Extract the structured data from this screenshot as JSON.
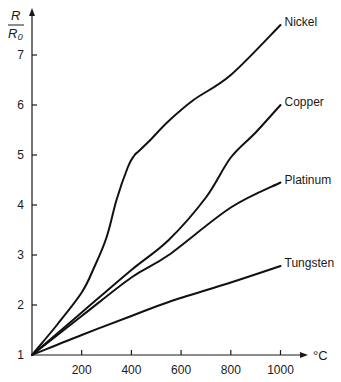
{
  "chart_data": {
    "type": "line",
    "title": "",
    "xlabel": "°C",
    "ylabel": "R / R₀",
    "ylabel_num": "R",
    "ylabel_den": "R₀",
    "xlim": [
      0,
      1100
    ],
    "ylim": [
      1,
      8
    ],
    "x_ticks": [
      200,
      400,
      600,
      800,
      1000
    ],
    "x_tick_labels": [
      "200",
      "400",
      "600",
      "800",
      "1000"
    ],
    "y_ticks": [
      1,
      2,
      3,
      4,
      5,
      6,
      7
    ],
    "y_tick_labels": [
      "1",
      "2",
      "3",
      "4",
      "5",
      "6",
      "7"
    ],
    "grid": false,
    "legend": "inline labels at curve ends",
    "series": [
      {
        "name": "Nickel",
        "x": [
          0,
          100,
          200,
          250,
          300,
          340,
          385,
          410,
          430,
          472,
          550,
          650,
          800,
          1000
        ],
        "values": [
          1,
          1.6,
          2.25,
          2.75,
          3.35,
          4.1,
          4.75,
          4.98,
          5.08,
          5.28,
          5.68,
          6.1,
          6.6,
          7.6
        ]
      },
      {
        "name": "Copper",
        "x": [
          0,
          200,
          400,
          550,
          700,
          800,
          900,
          1000
        ],
        "values": [
          1,
          1.85,
          2.7,
          3.3,
          4.15,
          4.95,
          5.45,
          6.0
        ]
      },
      {
        "name": "Platinum",
        "x": [
          0,
          200,
          400,
          550,
          800,
          1000
        ],
        "values": [
          1,
          1.78,
          2.55,
          3.0,
          3.95,
          4.45
        ]
      },
      {
        "name": "Tungsten",
        "x": [
          0,
          200,
          400,
          550,
          800,
          1000
        ],
        "values": [
          1,
          1.4,
          1.78,
          2.06,
          2.45,
          2.78
        ]
      }
    ]
  },
  "layout": {
    "origin_px": [
      32,
      355
    ],
    "px_per_x_unit": 0.2485,
    "px_per_y_unit": 50,
    "x_axis_end_px": 308,
    "y_axis_top_px": 8
  }
}
